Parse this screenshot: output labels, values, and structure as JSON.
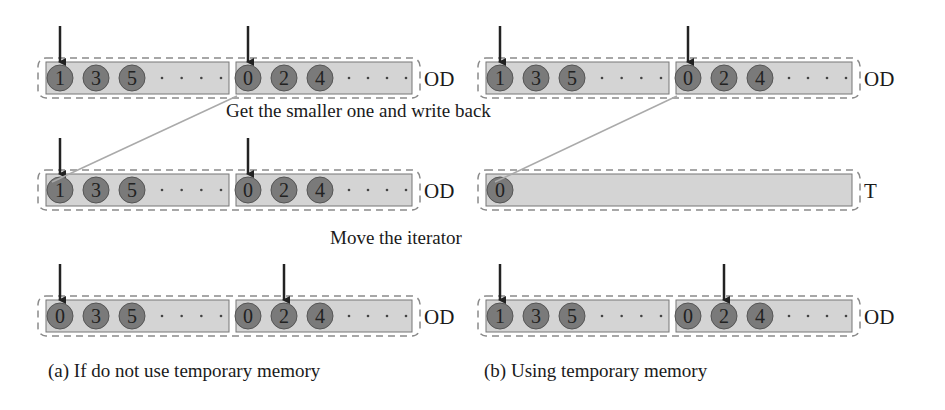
{
  "colors": {
    "array_fill": "#d4d4d4",
    "array_stroke": "#777777",
    "circle_fill": "#7a7a7a",
    "circle_stroke": "#555555",
    "dash": "#8a8a8a",
    "arrow": "#222222",
    "line": "#aaaaaa"
  },
  "step_labels": {
    "step1": "Get the smaller one and write back",
    "step2": "Move the iterator"
  },
  "captions": {
    "a": "(a) If do not use temporary memory",
    "b": "(b) Using temporary memory"
  },
  "panels": {
    "a": {
      "rows": [
        {
          "label": "OD",
          "left": [
            "1",
            "3",
            "5"
          ],
          "right": [
            "0",
            "2",
            "4"
          ],
          "ptr_left": 0,
          "ptr_right": 0
        },
        {
          "label": "OD",
          "left": [
            "1",
            "3",
            "5"
          ],
          "right": [
            "0",
            "2",
            "4"
          ],
          "ptr_left": 0,
          "ptr_right": 0
        },
        {
          "label": "OD",
          "left": [
            "0",
            "3",
            "5"
          ],
          "right": [
            "0",
            "2",
            "4"
          ],
          "ptr_left": 0,
          "ptr_right": 1
        }
      ]
    },
    "b": {
      "rows": [
        {
          "label": "OD",
          "left": [
            "1",
            "3",
            "5"
          ],
          "right": [
            "0",
            "2",
            "4"
          ],
          "ptr_left": 0,
          "ptr_right": 0
        },
        {
          "label": "T",
          "single": [
            "0"
          ]
        },
        {
          "label": "OD",
          "left": [
            "1",
            "3",
            "5"
          ],
          "right": [
            "0",
            "2",
            "4"
          ],
          "ptr_left": 0,
          "ptr_right": 1
        }
      ]
    }
  }
}
